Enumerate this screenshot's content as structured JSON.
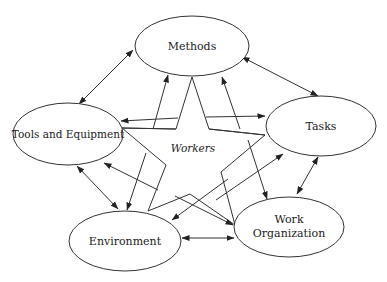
{
  "diagram": {
    "center": {
      "label": "Workers",
      "shape": "star"
    },
    "nodes": [
      {
        "id": "methods",
        "label": "Methods"
      },
      {
        "id": "tasks",
        "label": "Tasks"
      },
      {
        "id": "tools",
        "label": "Tools and Equipment"
      },
      {
        "id": "environment",
        "label": "Environment"
      },
      {
        "id": "work_organization",
        "label_line1": "Work",
        "label_line2": "Organization"
      }
    ],
    "edges": [
      {
        "from": "methods",
        "to": "tools",
        "type": "bidirectional"
      },
      {
        "from": "methods",
        "to": "tasks",
        "type": "bidirectional"
      },
      {
        "from": "tools",
        "to": "environment",
        "type": "bidirectional"
      },
      {
        "from": "tasks",
        "to": "work_organization",
        "type": "bidirectional"
      },
      {
        "from": "environment",
        "to": "work_organization",
        "type": "bidirectional"
      },
      {
        "from": "workers",
        "to": "methods",
        "type": "directed"
      },
      {
        "from": "workers",
        "to": "tasks",
        "type": "directed"
      },
      {
        "from": "workers",
        "to": "tools",
        "type": "directed"
      },
      {
        "from": "workers",
        "to": "environment",
        "type": "directed"
      },
      {
        "from": "workers",
        "to": "work_organization",
        "type": "directed"
      }
    ]
  }
}
